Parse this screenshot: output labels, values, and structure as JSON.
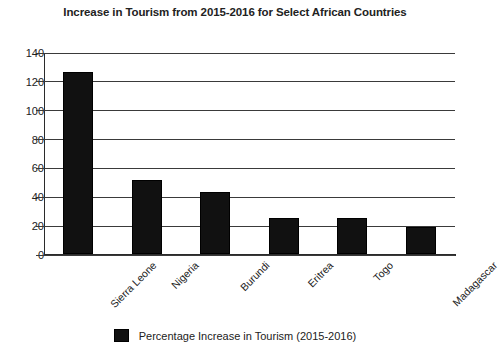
{
  "chart_data": {
    "type": "bar",
    "title": "Increase in Tourism from 2015-2016 for Select African Countries",
    "xlabel": "",
    "ylabel": "",
    "categories": [
      "Sierra Leone",
      "Nigeria",
      "Burundi",
      "Eritrea",
      "Togo",
      "Madagascar"
    ],
    "series": [
      {
        "name": "Percentage Increase in Tourism (2015-2016)",
        "color": "#111111",
        "values": [
          126,
          51,
          43,
          25,
          25,
          19
        ]
      }
    ],
    "values": [
      126,
      51,
      43,
      25,
      25,
      19
    ],
    "ylim": [
      0,
      140
    ],
    "ytick_labels": [
      "0",
      "20",
      "40",
      "60",
      "80",
      "100",
      "120",
      "140"
    ],
    "ytick_values": [
      0,
      20,
      40,
      60,
      80,
      100,
      120,
      140
    ],
    "grid": true,
    "grid_axis": "y",
    "legend_position": "bottom",
    "legend_entries": [
      "Percentage Increase in Tourism (2015-2016)"
    ],
    "xtick_label_rotation": -45
  }
}
